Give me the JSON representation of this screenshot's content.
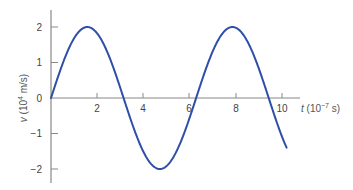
{
  "chart_data": {
    "type": "line",
    "title": "",
    "xlabel": "t (10^-7 s)",
    "ylabel": "v (10^4 m/s)",
    "xlim": [
      0,
      10.2
    ],
    "ylim": [
      -2.4,
      2.4
    ],
    "xticks": [
      2,
      4,
      6,
      8,
      10
    ],
    "yticks": [
      -2,
      -1,
      0,
      1,
      2
    ],
    "grid": false,
    "legend": null,
    "series": [
      {
        "name": "v(t)",
        "color": "#2e4fa6",
        "function": "2 sin(t)",
        "x": [
          0,
          0.5,
          1.0,
          1.57,
          2.0,
          2.5,
          3.14,
          3.5,
          4.0,
          4.71,
          5.0,
          5.5,
          6.28,
          6.5,
          7.0,
          7.85,
          8.5,
          9.0,
          9.42,
          10.0,
          10.2
        ],
        "values": [
          0,
          0.96,
          1.68,
          2.0,
          1.82,
          1.2,
          0,
          -0.7,
          -1.51,
          -2.0,
          -1.92,
          -1.41,
          0,
          0.43,
          1.31,
          2.0,
          1.6,
          0.82,
          0,
          -1.09,
          -1.4
        ]
      }
    ]
  },
  "labels": {
    "x_axis": {
      "var": "t",
      "unit_pre": " (10",
      "exp": "−7",
      "unit_post": " s)"
    },
    "y_axis": {
      "var": "v",
      "unit_pre": " (10",
      "exp": "4",
      "unit_post": " m/s)"
    },
    "x_ticks": [
      "2",
      "4",
      "6",
      "8",
      "10"
    ],
    "y_ticks": [
      "2",
      "1",
      "0",
      "−1",
      "−2"
    ]
  }
}
